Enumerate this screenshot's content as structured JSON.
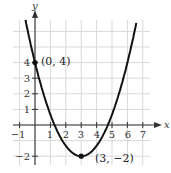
{
  "chart_data": {
    "type": "line",
    "title": "",
    "xlabel": "x",
    "ylabel": "y",
    "xlim": [
      -1.3,
      7.7
    ],
    "ylim": [
      -2.6,
      6.6
    ],
    "grid": true,
    "x_ticks": [
      -1,
      1,
      2,
      3,
      4,
      5,
      6,
      7
    ],
    "x_tick_labels": [
      "-1",
      "1",
      "2",
      "3",
      "4",
      "5",
      "6",
      "7"
    ],
    "y_ticks": [
      -2,
      1,
      2,
      3,
      4
    ],
    "y_tick_labels": [
      "-2",
      "1",
      "2",
      "3",
      "4"
    ],
    "series": [
      {
        "name": "parabola",
        "equation": "y = (2/3)(x - 3)^2 - 2",
        "x": [
          -0.6,
          0,
          1,
          2,
          3,
          4,
          5,
          6,
          6.6
        ],
        "y": [
          6.64,
          4,
          0.67,
          -1.33,
          -2,
          -1.33,
          0.67,
          4,
          6.64
        ]
      }
    ],
    "annotations": [
      {
        "label": "(0, 4)",
        "x": 0,
        "y": 4
      },
      {
        "label": "(3, −2)",
        "x": 3,
        "y": -2
      }
    ]
  },
  "labels": {
    "x_axis": "x",
    "y_axis": "y",
    "point_a": "(0, 4)",
    "point_b": "(3, −2)",
    "xt": [
      "−1",
      "1",
      "2",
      "3",
      "4",
      "5",
      "6",
      "7"
    ],
    "yt": [
      "−2",
      "1",
      "2",
      "3",
      "4"
    ]
  },
  "colors": {
    "grid": "#d9d9d9",
    "axis": "#333333",
    "curve": "#111111"
  }
}
